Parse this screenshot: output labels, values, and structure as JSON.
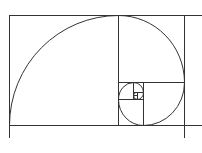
{
  "diagram": {
    "stroke_color": "#333333",
    "background_color": "#ffffff"
  }
}
